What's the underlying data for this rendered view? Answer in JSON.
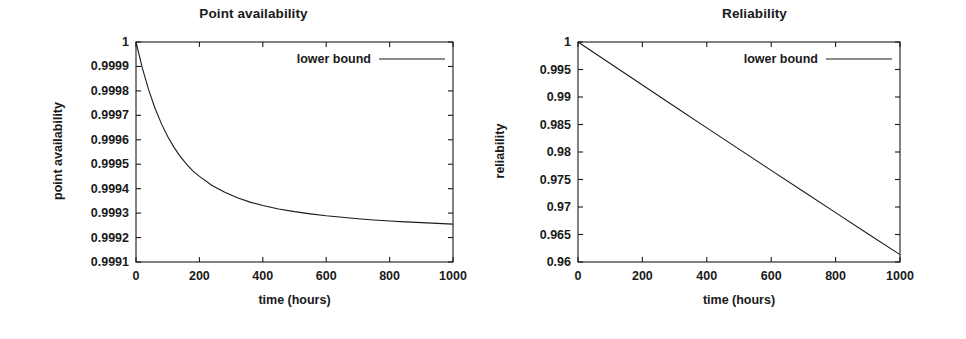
{
  "figure": {
    "background_color": "#ffffff",
    "foreground_color": "#1a1a1a",
    "panel_count": 2
  },
  "panels": [
    {
      "id": "point-availability",
      "title": "Point availability",
      "xlabel": "time (hours)",
      "ylabel": "point availability",
      "legend": "lower bound"
    },
    {
      "id": "reliability",
      "title": "Reliability",
      "xlabel": "time (hours)",
      "ylabel": "reliability",
      "legend": "reliability-legend"
    }
  ],
  "chart_data": [
    {
      "type": "line",
      "id": "point-availability",
      "title": "Point availability",
      "xlabel": "time (hours)",
      "ylabel": "point availability",
      "xlim": [
        0,
        1000
      ],
      "ylim": [
        0.9991,
        1.0
      ],
      "xticks": [
        0,
        200,
        400,
        600,
        800,
        1000
      ],
      "xticklabels": [
        "0",
        "200",
        "400",
        "600",
        "800",
        "1000"
      ],
      "yticks": [
        0.9991,
        0.9992,
        0.9993,
        0.9994,
        0.9995,
        0.9996,
        0.9997,
        0.9998,
        0.9999,
        1
      ],
      "yticklabels": [
        "0.9991",
        "0.9992",
        "0.9993",
        "0.9994",
        "0.9995",
        "0.9996",
        "0.9997",
        "0.9998",
        "0.9999",
        "1"
      ],
      "grid": false,
      "legend_position": "top-right",
      "series": [
        {
          "name": "lower bound",
          "color": "#1a1a1a",
          "x": [
            0,
            20,
            40,
            60,
            80,
            100,
            120,
            140,
            160,
            180,
            200,
            240,
            280,
            320,
            360,
            400,
            450,
            500,
            550,
            600,
            650,
            700,
            750,
            800,
            850,
            900,
            950,
            1000
          ],
          "y": [
            1.0,
            0.999893,
            0.999804,
            0.999729,
            0.999666,
            0.999613,
            0.999569,
            0.999531,
            0.999499,
            0.999472,
            0.99945,
            0.999413,
            0.999385,
            0.999363,
            0.999345,
            0.999331,
            0.999317,
            0.999306,
            0.999297,
            0.999289,
            0.999283,
            0.999277,
            0.999272,
            0.999268,
            0.999264,
            0.999261,
            0.999258,
            0.999255
          ]
        }
      ]
    },
    {
      "type": "line",
      "id": "reliability",
      "title": "Reliability",
      "xlabel": "time (hours)",
      "ylabel": "reliability",
      "xlim": [
        0,
        1000
      ],
      "ylim": [
        0.96,
        1.0
      ],
      "xticks": [
        0,
        200,
        400,
        600,
        800,
        1000
      ],
      "xticklabels": [
        "0",
        "200",
        "400",
        "600",
        "800",
        "1000"
      ],
      "yticks": [
        0.96,
        0.965,
        0.97,
        0.975,
        0.98,
        0.985,
        0.99,
        0.995,
        1
      ],
      "yticklabels": [
        "0.96",
        "0.965",
        "0.97",
        "0.975",
        "0.98",
        "0.985",
        "0.99",
        "0.995",
        "1"
      ],
      "grid": false,
      "legend_position": "top-right",
      "series": [
        {
          "name": "lower bound",
          "color": "#1a1a1a",
          "x": [
            0,
            100,
            200,
            300,
            400,
            500,
            600,
            700,
            800,
            900,
            1000
          ],
          "y": [
            1.0,
            0.99608,
            0.99217,
            0.98827,
            0.98439,
            0.98052,
            0.97666,
            0.97281,
            0.96897,
            0.96515,
            0.96134
          ]
        }
      ]
    }
  ]
}
